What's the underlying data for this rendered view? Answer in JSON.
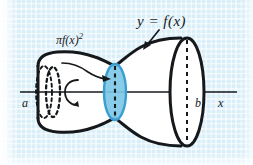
{
  "figure": {
    "background_color": "#d8eef8",
    "grid_color": "#a0d2e8",
    "ink_color": "#16191c",
    "disk_fill_color": "#7ec8e8",
    "disk_stroke_color": "#3a9fd0",
    "solid_fill_color": "#ffffff"
  },
  "labels": {
    "curve_label": "y = f(x)",
    "cross_section_area_pi": "π",
    "cross_section_area_fx": "f(x)",
    "cross_section_area_exp": "2",
    "left_bound": "a",
    "right_bound": "b",
    "axis_label": "x"
  },
  "annotations": {
    "curve_label_arrow": "arrow-to-surface",
    "area_label_arrow": "arrow-to-disk",
    "rotation_arrow": "revolution-arrow-about-x-axis"
  },
  "geometry": {
    "axis_y": 92,
    "axis_x_start": 20,
    "axis_x_end": 237,
    "left_cap_x": 38,
    "disk_x": 115,
    "right_cap_x": 187
  }
}
